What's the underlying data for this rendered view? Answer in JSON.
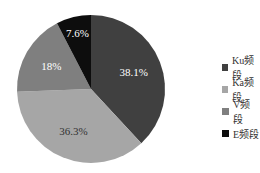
{
  "chart_data": {
    "type": "pie",
    "title": "",
    "categories": [
      "Ku频段",
      "Ka频段",
      "V频段",
      "E频段"
    ],
    "values": [
      38.1,
      36.3,
      18,
      7.6
    ],
    "labels": [
      "38.1%",
      "36.3%",
      "18%",
      "7.6%"
    ],
    "colors": [
      "#404040",
      "#a6a6a6",
      "#7f7f7f",
      "#0d0d0d"
    ],
    "label_colors": [
      "#ffffff",
      "#333333",
      "#ffffff",
      "#ffffff"
    ],
    "start_angle_deg": 0,
    "direction": "clockwise",
    "legend_position": "right"
  },
  "legend": {
    "items": [
      {
        "label": "Ku频段",
        "color": "#404040"
      },
      {
        "label": "Ka频段",
        "color": "#a6a6a6"
      },
      {
        "label": "V频段",
        "color": "#7f7f7f"
      },
      {
        "label": "E频段",
        "color": "#0d0d0d"
      }
    ]
  }
}
